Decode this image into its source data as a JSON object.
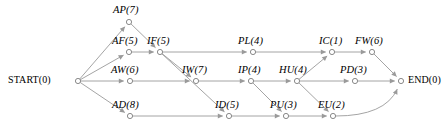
{
  "diagram": {
    "type": "activity-on-arrow-network",
    "width": 448,
    "height": 132,
    "colors": {
      "background": "#ffffff",
      "edge": "#9a9a9a",
      "node_stroke": "#7d7d7d",
      "node_fill": "#ffffff",
      "text": "#000000"
    },
    "nodes": [
      {
        "id": "START",
        "label": "START(0)",
        "code": "START",
        "duration": 0,
        "x": 78,
        "y": 81,
        "label_x": 8,
        "label_y": 75,
        "style": "terminal",
        "anchor": "right"
      },
      {
        "id": "AP",
        "label": "AP(7)",
        "code": "AP",
        "duration": 7,
        "x": 129,
        "y": 22,
        "label_x": 113,
        "label_y": 5,
        "style": "activity",
        "anchor": "above"
      },
      {
        "id": "AF",
        "label": "AF(5)",
        "code": "AF",
        "duration": 5,
        "x": 129,
        "y": 52,
        "label_x": 112,
        "label_y": 36,
        "style": "activity",
        "anchor": "above"
      },
      {
        "id": "IF",
        "label": "IF(5)",
        "code": "IF",
        "duration": 5,
        "x": 160,
        "y": 52,
        "label_x": 147,
        "label_y": 36,
        "style": "activity",
        "anchor": "above"
      },
      {
        "id": "AW",
        "label": "AW(6)",
        "code": "AW",
        "duration": 6,
        "x": 130,
        "y": 81,
        "label_x": 111,
        "label_y": 65,
        "style": "activity",
        "anchor": "above"
      },
      {
        "id": "AD",
        "label": "AD(8)",
        "code": "AD",
        "duration": 8,
        "x": 130,
        "y": 116,
        "label_x": 112,
        "label_y": 100,
        "style": "activity",
        "anchor": "above"
      },
      {
        "id": "IW",
        "label": "IW(7)",
        "code": "IW",
        "duration": 7,
        "x": 196,
        "y": 81,
        "label_x": 182,
        "label_y": 65,
        "style": "activity",
        "anchor": "above"
      },
      {
        "id": "ID",
        "label": "ID(5)",
        "code": "ID",
        "duration": 5,
        "x": 229,
        "y": 116,
        "label_x": 215,
        "label_y": 100,
        "style": "activity",
        "anchor": "above"
      },
      {
        "id": "PL",
        "label": "PL(4)",
        "code": "PL",
        "duration": 4,
        "x": 253,
        "y": 52,
        "label_x": 238,
        "label_y": 36,
        "style": "activity",
        "anchor": "above"
      },
      {
        "id": "IP",
        "label": "IP(4)",
        "code": "IP",
        "duration": 4,
        "x": 251,
        "y": 81,
        "label_x": 238,
        "label_y": 65,
        "style": "activity",
        "anchor": "above"
      },
      {
        "id": "HU",
        "label": "HU(4)",
        "code": "HU",
        "duration": 4,
        "x": 297,
        "y": 81,
        "label_x": 279,
        "label_y": 65,
        "style": "activity",
        "anchor": "above"
      },
      {
        "id": "PU",
        "label": "PU(3)",
        "code": "PU",
        "duration": 3,
        "x": 286,
        "y": 116,
        "label_x": 270,
        "label_y": 100,
        "style": "activity",
        "anchor": "above"
      },
      {
        "id": "EU",
        "label": "EU(2)",
        "code": "EU",
        "duration": 2,
        "x": 333,
        "y": 116,
        "label_x": 318,
        "label_y": 100,
        "style": "activity",
        "anchor": "above"
      },
      {
        "id": "IC",
        "label": "IC(1)",
        "code": "IC",
        "duration": 1,
        "x": 332,
        "y": 52,
        "label_x": 319,
        "label_y": 36,
        "style": "activity",
        "anchor": "above"
      },
      {
        "id": "FW",
        "label": "FW(6)",
        "code": "FW",
        "duration": 6,
        "x": 372,
        "y": 52,
        "label_x": 355,
        "label_y": 36,
        "style": "activity",
        "anchor": "above"
      },
      {
        "id": "PD",
        "label": "PD(3)",
        "code": "PD",
        "duration": 3,
        "x": 355,
        "y": 81,
        "label_x": 340,
        "label_y": 65,
        "style": "activity",
        "anchor": "above"
      },
      {
        "id": "END",
        "label": "END(0)",
        "code": "END",
        "duration": 0,
        "x": 401,
        "y": 81,
        "label_x": 408,
        "label_y": 75,
        "style": "terminal",
        "anchor": "left"
      }
    ],
    "edges": [
      {
        "from": "START",
        "to": "AP",
        "kind": "line",
        "arrow": true
      },
      {
        "from": "START",
        "to": "AF",
        "kind": "line",
        "arrow": true
      },
      {
        "from": "START",
        "to": "AW",
        "kind": "line",
        "arrow": true
      },
      {
        "from": "START",
        "to": "AD",
        "kind": "line",
        "arrow": true
      },
      {
        "from": "AP",
        "to": "IF",
        "kind": "line",
        "arrow": true
      },
      {
        "from": "AF",
        "to": "IF",
        "kind": "line",
        "arrow": true
      },
      {
        "from": "IF",
        "to": "PL",
        "kind": "line",
        "arrow": true
      },
      {
        "from": "IF",
        "to": "IW",
        "kind": "line",
        "arrow": true
      },
      {
        "from": "IF",
        "to": "ID",
        "kind": "line",
        "arrow": true
      },
      {
        "from": "AW",
        "to": "IW",
        "kind": "line",
        "arrow": true
      },
      {
        "from": "AD",
        "to": "ID",
        "kind": "line",
        "arrow": true
      },
      {
        "from": "IW",
        "to": "IP",
        "kind": "line",
        "arrow": true
      },
      {
        "from": "ID",
        "to": "PU",
        "kind": "line",
        "arrow": true
      },
      {
        "from": "IP",
        "to": "HU",
        "kind": "line",
        "arrow": true
      },
      {
        "from": "IP",
        "to": "PU",
        "kind": "line",
        "arrow": true
      },
      {
        "from": "PL",
        "to": "IC",
        "kind": "line",
        "arrow": true
      },
      {
        "from": "HU",
        "to": "IC",
        "kind": "line",
        "arrow": true
      },
      {
        "from": "HU",
        "to": "PD",
        "kind": "line",
        "arrow": true
      },
      {
        "from": "HU",
        "to": "EU",
        "kind": "line",
        "arrow": true
      },
      {
        "from": "PU",
        "to": "EU",
        "kind": "line",
        "arrow": true
      },
      {
        "from": "IC",
        "to": "FW",
        "kind": "line",
        "arrow": true
      },
      {
        "from": "FW",
        "to": "END",
        "kind": "line",
        "arrow": true
      },
      {
        "from": "PD",
        "to": "END",
        "kind": "line",
        "arrow": true
      },
      {
        "from": "EU",
        "to": "END",
        "kind": "curve",
        "arrow": true,
        "curve_cx": 385,
        "curve_cy": 116
      }
    ]
  }
}
